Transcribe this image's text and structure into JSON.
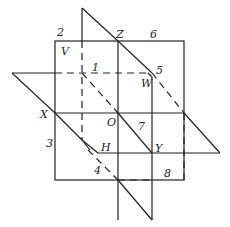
{
  "diagram": {
    "type": "geometry-planes",
    "point_labels": {
      "V": "V",
      "Z": "Z",
      "W": "W",
      "X": "X",
      "O": "O",
      "H": "H",
      "Y": "Y"
    },
    "region_labels": {
      "r1": "1",
      "r2": "2",
      "r3": "3",
      "r4": "4",
      "r5": "5",
      "r6": "6",
      "r7": "7",
      "r8": "8"
    }
  }
}
